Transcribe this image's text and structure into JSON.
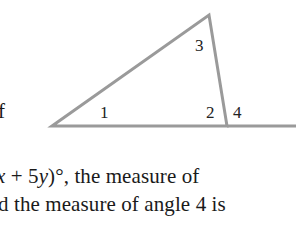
{
  "figure": {
    "stroke_color": "#9a9a9a",
    "angle_labels": {
      "angle1": "1",
      "angle2": "2",
      "angle3": "3",
      "angle4": "4"
    }
  },
  "text": {
    "left_fragment": "f",
    "line1": {
      "var_x": "x",
      "plus": " + 5",
      "var_y": "y",
      "rest": ")°, the measure of"
    },
    "line2": "d the measure of angle 4 is"
  }
}
